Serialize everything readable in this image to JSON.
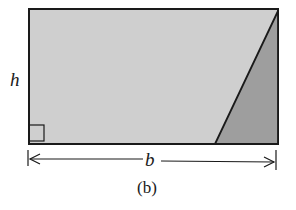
{
  "figure": {
    "height_label": "h",
    "base_label": "b",
    "caption": "(b)",
    "colors": {
      "rectangle_fill": "#cfcfcf",
      "triangle_fill": "#9e9e9e",
      "stroke": "#1a1a1a",
      "background": "#ffffff"
    }
  }
}
